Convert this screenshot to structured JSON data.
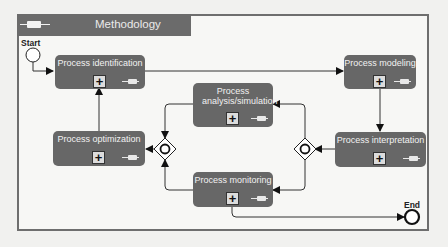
{
  "pool": {
    "title": "Methodology",
    "icon": "message-envelope-icon"
  },
  "events": {
    "start": {
      "label": "Start"
    },
    "end": {
      "label": "End"
    }
  },
  "tasks": [
    {
      "id": "identification",
      "label": "Process identification",
      "marker": "+"
    },
    {
      "id": "modeling",
      "label": "Process modeling",
      "marker": "+"
    },
    {
      "id": "analysis",
      "label": "Process analysis/simulation",
      "marker": "+"
    },
    {
      "id": "optimization",
      "label": "Process optimization",
      "marker": "+"
    },
    {
      "id": "interpretation",
      "label": "Process interpretation",
      "marker": "+"
    },
    {
      "id": "monitoring",
      "label": "Process monitoring",
      "marker": "+"
    }
  ],
  "gateways": [
    {
      "id": "gateway-left",
      "type": "inclusive"
    },
    {
      "id": "gateway-right",
      "type": "inclusive"
    }
  ],
  "flows": [
    [
      "Start",
      "Process identification"
    ],
    [
      "Process identification",
      "Process modeling"
    ],
    [
      "Process modeling",
      "Process interpretation"
    ],
    [
      "Process interpretation",
      "gateway-right"
    ],
    [
      "gateway-right",
      "Process analysis/simulation"
    ],
    [
      "gateway-right",
      "Process monitoring"
    ],
    [
      "Process analysis/simulation",
      "gateway-left"
    ],
    [
      "Process monitoring",
      "gateway-left"
    ],
    [
      "gateway-left",
      "Process optimization"
    ],
    [
      "Process optimization",
      "Process identification"
    ],
    [
      "Process monitoring",
      "End"
    ]
  ],
  "colors": {
    "task_fill": "#676767",
    "header_fill": "#6b6b6b",
    "border": "#6e6e6e"
  }
}
